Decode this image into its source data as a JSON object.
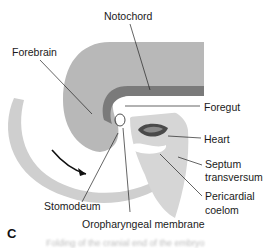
{
  "figure": {
    "panel_label": "C",
    "caption_text": "Folding of the cranial end of the embryo",
    "labels": {
      "notochord": "Notochord",
      "forebrain": "Forebrain",
      "foregut": "Foregut",
      "heart": "Heart",
      "septum_line1": "Septum",
      "septum_line2": "transversum",
      "pericardial_line1": "Pericardial",
      "pericardial_line2": "coelom",
      "stomodeum": "Stomodeum",
      "oropharyngeal": "Oropharyngeal membrane"
    },
    "colors": {
      "neural_tube": "#b9b9b9",
      "notochord": "#7a7a7a",
      "mesoderm": "#d4d4d4",
      "heart": "#555555",
      "arrow": "#111111"
    }
  }
}
